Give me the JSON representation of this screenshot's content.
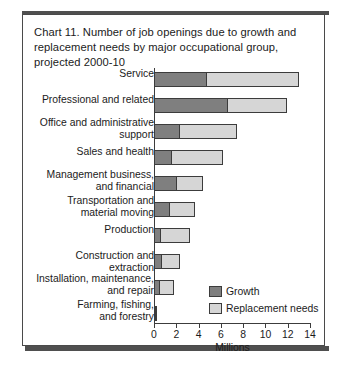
{
  "card": {
    "title": "Chart 11. Number of job openings due to growth and replacement needs by major occupational group, projected 2000-10"
  },
  "colors": {
    "growth": "#7f7f7f",
    "replacement": "#d6d6d6",
    "outline": "#3c3c3c",
    "text": "#1b1b1b",
    "frame": "#4a4a4a"
  },
  "legend": {
    "items": [
      {
        "label": "Growth",
        "color": "#7f7f7f"
      },
      {
        "label": "Replacement needs",
        "color": "#d6d6d6"
      }
    ]
  },
  "chart_data": {
    "type": "bar",
    "orientation": "horizontal",
    "stacked": true,
    "title": "Chart 11. Number of job openings due to growth and replacement needs by major occupational group, projected 2000-10",
    "xlabel": "Millions",
    "ylabel": "",
    "xlim": [
      0,
      14
    ],
    "xticks": [
      0,
      2,
      4,
      6,
      8,
      10,
      12,
      14
    ],
    "xtick_labels": [
      "0",
      "2",
      "4",
      "6",
      "8",
      "10",
      "12",
      "14"
    ],
    "grid": false,
    "legend_position": "inside-right",
    "categories": [
      "Service",
      "Professional and related",
      "Office and administrative\nsupport",
      "Sales and health",
      "Management business,\nand financial",
      "Transportation and\nmaterial moving",
      "Production",
      "Construction and extraction",
      "Installation, maintenance,\nand repair",
      "Farming, fishing,\nand forestry"
    ],
    "series": [
      {
        "name": "Growth",
        "color": "#7f7f7f",
        "values": [
          4.8,
          6.6,
          2.3,
          1.6,
          2.1,
          1.4,
          0.6,
          0.7,
          0.5,
          0.1
        ]
      },
      {
        "name": "Replacement needs",
        "color": "#d6d6d6",
        "values": [
          8.3,
          5.4,
          5.2,
          4.7,
          2.4,
          2.4,
          2.7,
          1.7,
          1.4,
          0.2
        ]
      }
    ],
    "totals": [
      13.1,
      12.0,
      7.5,
      6.3,
      4.5,
      3.8,
      3.3,
      2.4,
      1.9,
      0.3
    ]
  }
}
